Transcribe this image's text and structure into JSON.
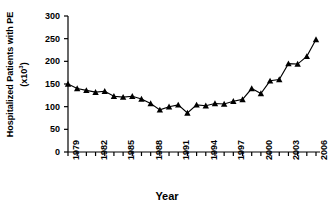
{
  "chart_data": {
    "type": "line",
    "title": "",
    "xlabel": "Year",
    "ylabel_line1": "Hospitalized Patients with PE",
    "ylabel_line2": "(x10",
    "ylabel_line2_sup": "3",
    "ylabel_line2_end": ")",
    "ylim": [
      0,
      300
    ],
    "xlim": [
      1979,
      2006
    ],
    "yticks": [
      0,
      50,
      100,
      150,
      200,
      250,
      300
    ],
    "ytick_labels": [
      "0",
      "50",
      "100",
      "150",
      "200",
      "250",
      "300"
    ],
    "xticks": [
      1979,
      1980,
      1981,
      1982,
      1983,
      1984,
      1985,
      1986,
      1987,
      1988,
      1989,
      1990,
      1991,
      1992,
      1993,
      1994,
      1995,
      1996,
      1997,
      1998,
      1999,
      2000,
      2001,
      2002,
      2003,
      2004,
      2005,
      2006
    ],
    "xtick_labels_shown": [
      "1979",
      "1982",
      "1985",
      "1988",
      "1991",
      "1994",
      "1997",
      "2000",
      "2003",
      "2006"
    ],
    "xtick_label_interval": 3,
    "grid": false,
    "legend": false,
    "marker": "triangle",
    "marker_color": "#000000",
    "line_color": "#000000",
    "categories": [
      1979,
      1980,
      1981,
      1982,
      1983,
      1984,
      1985,
      1986,
      1987,
      1988,
      1989,
      1990,
      1991,
      1992,
      1993,
      1994,
      1995,
      1996,
      1997,
      1998,
      1999,
      2000,
      2001,
      2002,
      2003,
      2004,
      2005,
      2006
    ],
    "values": [
      150,
      140,
      136,
      132,
      134,
      123,
      121,
      123,
      117,
      107,
      93,
      100,
      104,
      86,
      104,
      102,
      107,
      106,
      112,
      116,
      140,
      129,
      157,
      160,
      195,
      194,
      211,
      248
    ],
    "series": [
      {
        "name": "Hospitalized Patients with PE",
        "values": [
          150,
          140,
          136,
          132,
          134,
          123,
          121,
          123,
          117,
          107,
          93,
          100,
          104,
          86,
          104,
          102,
          107,
          106,
          112,
          116,
          140,
          129,
          157,
          160,
          195,
          194,
          211,
          248
        ]
      }
    ]
  }
}
